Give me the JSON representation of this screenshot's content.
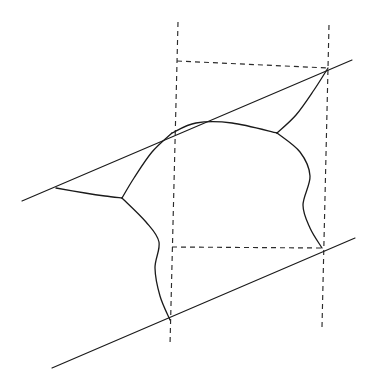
{
  "figure": {
    "width": 370,
    "height": 389,
    "background_color": "#ffffff",
    "stroke_color": "#1a1a1a",
    "dash_color": "#2b2b2b",
    "dash_pattern": "5 4"
  },
  "chart_data": {
    "type": "diagram",
    "xlabel": "",
    "ylabel": "",
    "xlim": [
      0,
      370
    ],
    "ylim": [
      0,
      389
    ],
    "grid": false,
    "legend": "none",
    "coordinate_note": "Pixel coordinates, origin at top-left, y increases downward.",
    "elements": [
      {
        "name": "upper-tangent-line",
        "kind": "line",
        "start": [
          22,
          201
        ],
        "end": [
          352,
          60
        ],
        "style": "solid"
      },
      {
        "name": "lower-tangent-line",
        "kind": "line",
        "start": [
          52,
          368
        ],
        "end": [
          355,
          238
        ],
        "style": "solid"
      },
      {
        "name": "left-vertical-dashed-line",
        "kind": "line",
        "start": [
          178,
          22
        ],
        "end": [
          170,
          345
        ],
        "style": "dashed"
      },
      {
        "name": "right-vertical-dashed-line",
        "kind": "line",
        "start": [
          329,
          25
        ],
        "end": [
          322,
          327
        ],
        "style": "dashed"
      },
      {
        "name": "upper-horizontal-dashed-line",
        "kind": "line",
        "start": [
          177,
          61
        ],
        "end": [
          328,
          68
        ],
        "style": "dashed"
      },
      {
        "name": "lower-horizontal-dashed-line",
        "kind": "line",
        "start": [
          172,
          247
        ],
        "end": [
          322,
          248
        ],
        "style": "dashed"
      },
      {
        "name": "left-cusp-arc",
        "kind": "curve",
        "style": "solid",
        "points": [
          [
            56,
            188
          ],
          [
            85,
            193
          ],
          [
            105,
            196
          ],
          [
            122,
            198
          ]
        ]
      },
      {
        "name": "left-junction-to-upper-tangency-arc",
        "kind": "curve",
        "style": "solid",
        "points": [
          [
            122,
            198
          ],
          [
            134,
            178
          ],
          [
            152,
            152
          ],
          [
            172,
            133
          ]
        ]
      },
      {
        "name": "dome-arc",
        "kind": "curve",
        "style": "solid",
        "points": [
          [
            172,
            133
          ],
          [
            196,
            123
          ],
          [
            232,
            123
          ],
          [
            277,
            133
          ]
        ]
      },
      {
        "name": "right-junction-to-upper-tangency-arc",
        "kind": "curve",
        "style": "solid",
        "points": [
          [
            277,
            133
          ],
          [
            296,
            115
          ],
          [
            314,
            90
          ],
          [
            328,
            68
          ]
        ]
      },
      {
        "name": "left-descending-wavy-arc",
        "kind": "curve",
        "style": "solid",
        "points": [
          [
            122,
            198
          ],
          [
            146,
            222
          ],
          [
            159,
            242
          ],
          [
            155,
            268
          ],
          [
            160,
            296
          ],
          [
            170,
            320
          ]
        ]
      },
      {
        "name": "right-descending-wavy-arc",
        "kind": "curve",
        "style": "solid",
        "points": [
          [
            277,
            133
          ],
          [
            300,
            152
          ],
          [
            310,
            176
          ],
          [
            303,
            205
          ],
          [
            310,
            228
          ],
          [
            322,
            248
          ]
        ]
      }
    ],
    "marked_points": [
      {
        "name": "left-upper-cusp",
        "xy": [
          56,
          188
        ],
        "description": "curve meets upper tangent line"
      },
      {
        "name": "left-triple-junction",
        "xy": [
          122,
          198
        ],
        "description": "three curve branches meet"
      },
      {
        "name": "upper-left-tangency",
        "xy": [
          172,
          133
        ],
        "description": "dome arc touches upper tangent line"
      },
      {
        "name": "right-triple-junction",
        "xy": [
          277,
          133
        ],
        "description": "three curve branches meet"
      },
      {
        "name": "upper-right-corner-point",
        "xy": [
          328,
          68
        ],
        "description": "curve, upper line and both dashed lines converge"
      },
      {
        "name": "lower-left-contact",
        "xy": [
          170,
          320
        ],
        "description": "curve meets lower tangent line and left dashed line"
      },
      {
        "name": "lower-right-contact",
        "xy": [
          322,
          248
        ],
        "description": "curve meets lower tangent line and right dashed line"
      }
    ]
  }
}
